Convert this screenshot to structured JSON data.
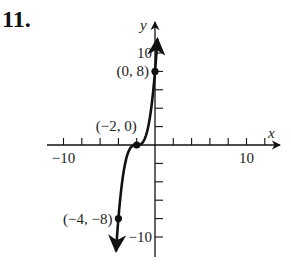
{
  "problem": {
    "number": "11."
  },
  "chart_data": {
    "type": "line",
    "title": "",
    "function": "y = (x + 2)^3",
    "xlabel": "x",
    "ylabel": "y",
    "xlim": [
      -11,
      13
    ],
    "ylim": [
      -12,
      12
    ],
    "x_tick_step": 2,
    "y_tick_step": 2,
    "x_tick_labels": [
      {
        "value": -10,
        "text": "−10"
      },
      {
        "value": 10,
        "text": "10"
      }
    ],
    "y_tick_labels": [
      {
        "value": 10,
        "text": "10"
      },
      {
        "value": -10,
        "text": "−10"
      }
    ],
    "grid": false,
    "series": [
      {
        "name": "y = (x+2)^3",
        "color": "#111111",
        "x_range": [
          -4.26,
          0.26
        ],
        "arrows": "both"
      }
    ],
    "points": [
      {
        "x": 0,
        "y": 8,
        "label": "(0, 8)"
      },
      {
        "x": -2,
        "y": 0,
        "label": "(−2, 0)"
      },
      {
        "x": -4,
        "y": -8,
        "label": "(−4, −8)"
      }
    ]
  },
  "colors": {
    "ink": "#111111",
    "background": "#ffffff"
  }
}
